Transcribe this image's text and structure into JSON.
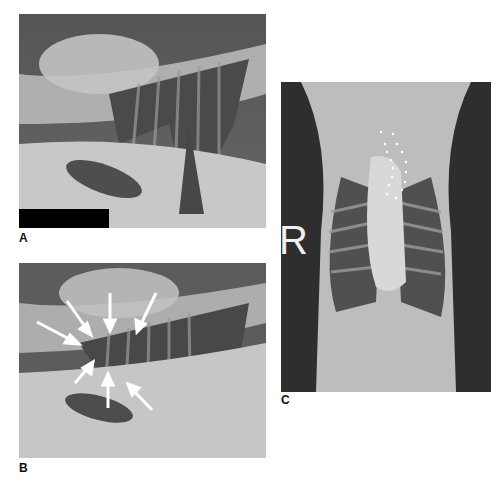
{
  "figure": {
    "panels": [
      {
        "id": "A",
        "label": "A",
        "view": "lateral thoracic radiograph",
        "annotations": "black redaction bar lower-left"
      },
      {
        "id": "B",
        "label": "B",
        "view": "lateral thoracic radiograph",
        "annotations": "7 white arrows outlining structure"
      },
      {
        "id": "C",
        "label": "C",
        "view": "ventrodorsal thoracic radiograph",
        "marker": "R",
        "annotations": "white dotted outline"
      }
    ]
  },
  "colors": {
    "background": "#ffffff",
    "xray_dark": "#3a3a3a",
    "xray_mid": "#8a8a8a",
    "xray_light": "#d8d8d8",
    "arrow": "#ffffff"
  }
}
